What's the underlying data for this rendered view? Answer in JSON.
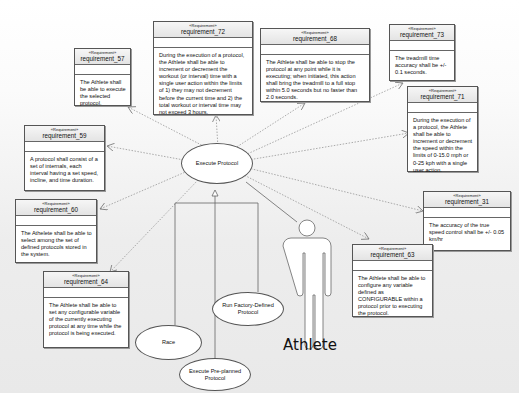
{
  "diagram": {
    "type": "SysML use case / requirements diagram",
    "stereotype": "«Requirement»",
    "colors": {
      "border": "#555555",
      "header": "#ececec",
      "background": "#ebebeb"
    }
  },
  "requirements": [
    {
      "id": "requirement_57",
      "text": "The Athlete shall be able to execute the selected protocol."
    },
    {
      "id": "requirement_72",
      "text": "During the execution of a protocol, the Athlete shall be able to increment or decrement the workout (or interval) time with a single user action within the limits of 1) they may not decrement before the current time and 2) the total workout or interval time may not exceed 3 hours."
    },
    {
      "id": "requirement_68",
      "text": "The Athlete shall be able to stop the protocol at any point while it is executing; when initiated, this action shall bring the treadmill to a full stop within 5.0 seconds but no faster than 2.0 seconds."
    },
    {
      "id": "requirement_73",
      "text": "The treadmill time accuracy shall be +/- 0.1 seconds."
    },
    {
      "id": "requirement_71",
      "text": "During the execution of a protocol, the Athlete shall be able to increment or decrement the speed within the limits of 0-15.0 mph or 0-25 kph with a single user action."
    },
    {
      "id": "requirement_59",
      "text": "A protocol shall consist of a set of internals, each interval having a set speed, incline, and time duration."
    },
    {
      "id": "requirement_60",
      "text": "The Athelete shall be able to select among the set of defined protocols stored in the system."
    },
    {
      "id": "requirement_31",
      "text": "The accuracy of the true speed control shall be +/- 0.05 km/hr"
    },
    {
      "id": "requirement_63",
      "text": "The Athlete shall be able to configure any variable defined as CONFIGURABLE within a protocol prior to executing the protocol."
    },
    {
      "id": "requirement_64",
      "text": "The Athlete shall be able to set any configurable variable of the currently executing protocol at any time while the protocol is being executed."
    }
  ],
  "use_cases": {
    "main": "Execute Protocol",
    "race": "Race",
    "factory": "Run Factory-Defined Protocol",
    "preplanned": "Execute Pre-planned Protocol"
  },
  "actor": {
    "name": "Athlete"
  }
}
